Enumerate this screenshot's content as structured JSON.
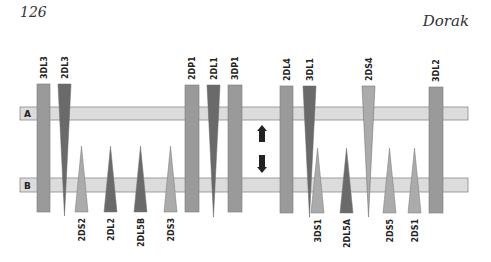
{
  "header": {
    "page_number": "126",
    "author": "Dorak"
  },
  "diagram": {
    "haplotypes": [
      {
        "label": "A",
        "y": 107,
        "height": 13
      },
      {
        "label": "B",
        "y": 178,
        "height": 14
      }
    ],
    "colors": {
      "bar_fill": "#dcdcdc",
      "bar_stroke": "#8a8a8a",
      "medium": "#9a9a9a",
      "dark": "#6a6a6a",
      "light": "#ababab"
    },
    "genes": [
      {
        "name": "3DL3",
        "shape": "rect",
        "x": 37,
        "width": 13,
        "top": 84,
        "bottom": 212,
        "color": "medium",
        "label_pos": "top"
      },
      {
        "name": "2DL3",
        "shape": "down",
        "x": 58,
        "width": 13,
        "top": 84,
        "bottom": 216,
        "color": "dark",
        "label_pos": "top"
      },
      {
        "name": "2DS2",
        "shape": "up",
        "x": 75,
        "width": 13,
        "top": 146,
        "bottom": 212,
        "color": "light",
        "label_pos": "bottom"
      },
      {
        "name": "2DL2",
        "shape": "up",
        "x": 104,
        "width": 13,
        "top": 146,
        "bottom": 212,
        "color": "dark",
        "label_pos": "bottom"
      },
      {
        "name": "2DL5B",
        "shape": "up",
        "x": 134,
        "width": 13,
        "top": 146,
        "bottom": 212,
        "color": "dark",
        "label_pos": "bottom"
      },
      {
        "name": "2DS3",
        "shape": "up",
        "x": 164,
        "width": 13,
        "top": 146,
        "bottom": 212,
        "color": "light",
        "label_pos": "bottom"
      },
      {
        "name": "2DP1",
        "shape": "rect",
        "x": 185,
        "width": 14,
        "top": 85,
        "bottom": 212,
        "color": "medium",
        "label_pos": "top"
      },
      {
        "name": "2DL1",
        "shape": "down",
        "x": 207,
        "width": 13,
        "top": 85,
        "bottom": 217,
        "color": "dark",
        "label_pos": "top"
      },
      {
        "name": "3DP1",
        "shape": "rect",
        "x": 228,
        "width": 14,
        "top": 85,
        "bottom": 212,
        "color": "medium",
        "label_pos": "top"
      },
      {
        "name": "2DL4",
        "shape": "rect",
        "x": 280,
        "width": 13,
        "top": 86,
        "bottom": 213,
        "color": "medium",
        "label_pos": "top"
      },
      {
        "name": "3DL1",
        "shape": "down",
        "x": 303,
        "width": 13,
        "top": 86,
        "bottom": 217,
        "color": "dark",
        "label_pos": "top"
      },
      {
        "name": "3DS1",
        "shape": "up",
        "x": 311,
        "width": 13,
        "top": 148,
        "bottom": 213,
        "color": "light",
        "label_pos": "bottom"
      },
      {
        "name": "2DL5A",
        "shape": "up",
        "x": 340,
        "width": 13,
        "top": 148,
        "bottom": 213,
        "color": "dark",
        "label_pos": "bottom"
      },
      {
        "name": "2DS4",
        "shape": "down",
        "x": 362,
        "width": 13,
        "top": 86,
        "bottom": 217,
        "color": "light",
        "label_pos": "top"
      },
      {
        "name": "2DS5",
        "shape": "up",
        "x": 383,
        "width": 13,
        "top": 148,
        "bottom": 213,
        "color": "light",
        "label_pos": "bottom"
      },
      {
        "name": "2DS1",
        "shape": "up",
        "x": 408,
        "width": 13,
        "top": 148,
        "bottom": 213,
        "color": "light",
        "label_pos": "bottom"
      },
      {
        "name": "3DL2",
        "shape": "rect",
        "x": 429,
        "width": 14,
        "top": 87,
        "bottom": 213,
        "color": "medium",
        "label_pos": "top"
      }
    ],
    "arrows": [
      {
        "direction": "up",
        "x": 262,
        "top": 125,
        "bottom": 142
      },
      {
        "direction": "down",
        "x": 262,
        "top": 155,
        "bottom": 173
      }
    ]
  }
}
